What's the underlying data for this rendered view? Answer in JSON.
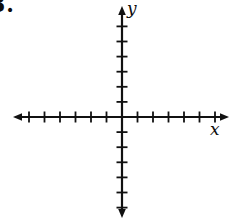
{
  "page": {
    "background": "#ffffff",
    "ink": "#111111"
  },
  "problem_number": "3.",
  "chart_data": {
    "type": "scatter",
    "title": "",
    "xlabel": "x",
    "ylabel": "y",
    "series": [],
    "xlim": [
      -7,
      7
    ],
    "ylim": [
      -7,
      7
    ],
    "x_ticks_per_side": 6,
    "y_ticks_per_side": 6,
    "tick_labels_shown": false,
    "grid": false,
    "axis_arrows": "both-ends",
    "axis_color": "#111111"
  }
}
